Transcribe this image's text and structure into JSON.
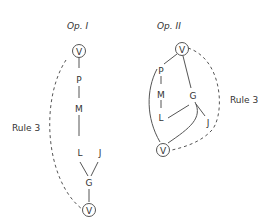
{
  "diagram": {
    "left": {
      "title": "Op. I",
      "rule_label": "Rule 3",
      "nodes": {
        "v_top": "V",
        "p": "P",
        "m": "M",
        "l": "L",
        "j": "J",
        "g": "G",
        "v_bottom": "V"
      }
    },
    "right": {
      "title": "Op. II",
      "rule_label": "Rule 3",
      "nodes": {
        "v_top": "V",
        "p": "P",
        "m": "M",
        "l": "L",
        "g": "G",
        "j": "J",
        "v_bottom": "V"
      }
    }
  }
}
